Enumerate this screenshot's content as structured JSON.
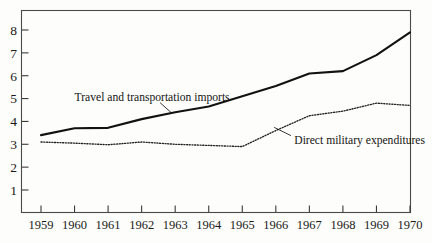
{
  "chart_data": {
    "type": "line",
    "title": "",
    "subtitle": "",
    "xlabel": "",
    "ylabel": "",
    "categories": [
      "1959",
      "1960",
      "1961",
      "1962",
      "1963",
      "1964",
      "1965",
      "1966",
      "1967",
      "1968",
      "1969",
      "1970"
    ],
    "x": [
      1959,
      1960,
      1961,
      1962,
      1963,
      1964,
      1965,
      1966,
      1967,
      1968,
      1969,
      1970
    ],
    "xlim": [
      1959,
      1970
    ],
    "ylim": [
      0,
      8.6
    ],
    "y_ticks": [
      1,
      2,
      3,
      4,
      5,
      6,
      7,
      8
    ],
    "y_tick_labels": [
      "1",
      "2",
      "3",
      "4",
      "5",
      "6",
      "7",
      "8"
    ],
    "x_ticks": [
      1959,
      1960,
      1961,
      1962,
      1963,
      1964,
      1965,
      1966,
      1967,
      1968,
      1969,
      1970
    ],
    "x_tick_labels": [
      "1959",
      "1960",
      "1961",
      "1962",
      "1963",
      "1964",
      "1965",
      "1966",
      "1967",
      "1968",
      "1969",
      "1970"
    ],
    "grid": false,
    "legend_position": "inline-annotation",
    "series": [
      {
        "name": "Travel and transportation imports",
        "style": "solid",
        "color": "#121210",
        "values": [
          3.4,
          3.7,
          3.72,
          4.1,
          4.4,
          4.65,
          5.1,
          5.55,
          6.1,
          6.2,
          6.9,
          7.9
        ]
      },
      {
        "name": "Direct military expenditures",
        "style": "dotted",
        "color": "#222220",
        "values": [
          3.1,
          3.05,
          2.98,
          3.1,
          3.0,
          2.95,
          2.9,
          3.6,
          4.25,
          4.45,
          4.8,
          4.7
        ]
      }
    ],
    "annotations": [
      {
        "id": "travel-imports-label",
        "text": "Travel and transportation imports",
        "anchor_x": 1960.0,
        "anchor_y": 5.05,
        "leader_from": [
          1962.55,
          4.82
        ],
        "leader_to": [
          1962.9,
          4.36
        ]
      },
      {
        "id": "military-expenditures-label",
        "text": "Direct military expenditures",
        "anchor_x": 1966.55,
        "anchor_y": 3.18,
        "leader_from": [
          1966.45,
          3.38
        ],
        "leader_to": [
          1965.95,
          3.74
        ]
      }
    ]
  },
  "figure": {
    "background_color": "#fdfdfb",
    "frame_color": "#4a4a48"
  }
}
